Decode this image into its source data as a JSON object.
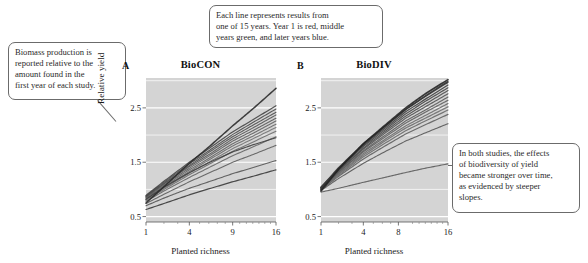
{
  "figure": {
    "background_color": "#ffffff",
    "plot_background_color": "#d4d4d4",
    "gridline_color": "#ffffff"
  },
  "callouts": [
    {
      "id": "biomass",
      "lines": [
        "Biomass production is",
        "reported relative to the",
        "amount found in the",
        "first year of each study."
      ]
    },
    {
      "id": "years",
      "lines": [
        "Each line represents results from",
        "one of 15 years. Year 1 is red, middle",
        "years green, and later years blue."
      ]
    },
    {
      "id": "slopes",
      "lines": [
        "In both studies, the effects",
        "of biodiversity of yield",
        "became stronger over time,",
        "as evidenced by steeper",
        "slopes."
      ]
    }
  ],
  "chart_data": [
    {
      "type": "line",
      "panel_letter": "A",
      "title": "BioCON",
      "xlabel": "Planted richness",
      "ylabel": "Relative yield",
      "x_ticks": [
        1,
        4,
        9,
        16
      ],
      "x_tick_labels": [
        "1",
        "4",
        "9",
        "16"
      ],
      "y_ticks": [
        0.5,
        1.5,
        2.5
      ],
      "y_tick_labels": [
        "0.5",
        "1.5",
        "2.5"
      ],
      "xlim": [
        1,
        16
      ],
      "ylim": [
        0.4,
        3.05
      ],
      "x_scale": "sqrt",
      "grid": true,
      "legend": "none",
      "x": [
        1,
        2,
        4,
        6,
        9,
        12,
        16
      ],
      "series": [
        {
          "name": "Year 1",
          "color": "#3a3a3a",
          "width": 1.2,
          "values": [
            0.63,
            0.74,
            0.9,
            1.01,
            1.14,
            1.24,
            1.36
          ]
        },
        {
          "name": "Year 2",
          "color": "#555555",
          "width": 1.1,
          "values": [
            0.7,
            0.84,
            1.02,
            1.14,
            1.29,
            1.4,
            1.53
          ]
        },
        {
          "name": "Year 3",
          "color": "#5e5e5e",
          "width": 1.1,
          "values": [
            0.74,
            0.91,
            1.14,
            1.3,
            1.5,
            1.64,
            1.81
          ]
        },
        {
          "name": "Year 4",
          "color": "#666666",
          "width": 1.1,
          "values": [
            0.78,
            0.97,
            1.22,
            1.4,
            1.62,
            1.78,
            1.97
          ]
        },
        {
          "name": "Year 5",
          "color": "#6e6e6e",
          "width": 1.1,
          "values": [
            0.8,
            1.0,
            1.27,
            1.46,
            1.7,
            1.87,
            2.07
          ]
        },
        {
          "name": "Year 6",
          "color": "#737373",
          "width": 1.1,
          "values": [
            0.81,
            1.02,
            1.3,
            1.5,
            1.75,
            1.93,
            2.14
          ]
        },
        {
          "name": "Year 7",
          "color": "#6a6a6a",
          "width": 1.1,
          "values": [
            0.82,
            1.04,
            1.33,
            1.54,
            1.8,
            1.98,
            2.2
          ]
        },
        {
          "name": "Year 8",
          "color": "#636363",
          "width": 1.1,
          "values": [
            0.84,
            1.06,
            1.36,
            1.57,
            1.84,
            2.03,
            2.26
          ]
        },
        {
          "name": "Year 9",
          "color": "#5c5c5c",
          "width": 1.1,
          "values": [
            0.85,
            1.08,
            1.39,
            1.61,
            1.89,
            2.08,
            2.31
          ]
        },
        {
          "name": "Year 10",
          "color": "#565656",
          "width": 1.1,
          "values": [
            0.86,
            1.1,
            1.42,
            1.64,
            1.93,
            2.13,
            2.37
          ]
        },
        {
          "name": "Year 11",
          "color": "#4f4f4f",
          "width": 1.1,
          "values": [
            0.87,
            1.11,
            1.44,
            1.68,
            1.97,
            2.18,
            2.42
          ]
        },
        {
          "name": "Year 12",
          "color": "#4a4a4a",
          "width": 1.1,
          "values": [
            0.88,
            1.13,
            1.47,
            1.71,
            2.01,
            2.23,
            2.48
          ]
        },
        {
          "name": "Year 13",
          "color": "#454545",
          "width": 1.2,
          "values": [
            0.89,
            1.15,
            1.5,
            1.75,
            2.06,
            2.28,
            2.54
          ]
        },
        {
          "name": "Year 14",
          "color": "#404040",
          "width": 1.2,
          "values": [
            0.82,
            1.04,
            1.31,
            1.49,
            1.69,
            1.82,
            1.95
          ]
        },
        {
          "name": "Year 15",
          "color": "#2b2b2b",
          "width": 1.5,
          "values": [
            0.75,
            1.05,
            1.48,
            1.78,
            2.17,
            2.48,
            2.86
          ]
        }
      ]
    },
    {
      "type": "line",
      "panel_letter": "B",
      "title": "BioDIV",
      "xlabel": "Planted richness",
      "ylabel": "",
      "x_ticks": [
        1,
        4,
        8,
        16
      ],
      "x_tick_labels": [
        "1",
        "4",
        "8",
        "16"
      ],
      "y_ticks": [
        0.5,
        1.5,
        2.5
      ],
      "y_tick_labels": [
        "0.5",
        "1.5",
        "2.5"
      ],
      "xlim": [
        1,
        16
      ],
      "ylim": [
        0.4,
        3.05
      ],
      "x_scale": "sqrt",
      "grid": true,
      "legend": "none",
      "x": [
        1,
        2,
        4,
        6,
        9,
        12,
        16
      ],
      "series": [
        {
          "name": "Year 1",
          "color": "#5a5a5a",
          "width": 1.1,
          "values": [
            0.95,
            1.02,
            1.13,
            1.21,
            1.31,
            1.39,
            1.47
          ]
        },
        {
          "name": "Year 2",
          "color": "#565656",
          "width": 1.1,
          "values": [
            0.98,
            1.2,
            1.48,
            1.67,
            1.89,
            2.04,
            2.21
          ]
        },
        {
          "name": "Year 3",
          "color": "#606060",
          "width": 1.2,
          "values": [
            0.99,
            1.24,
            1.56,
            1.77,
            2.02,
            2.19,
            2.38
          ]
        },
        {
          "name": "Year 4",
          "color": "#6a6a6a",
          "width": 1.2,
          "values": [
            1.0,
            1.26,
            1.6,
            1.82,
            2.08,
            2.26,
            2.46
          ]
        },
        {
          "name": "Year 5",
          "color": "#707070",
          "width": 1.3,
          "values": [
            1.0,
            1.28,
            1.63,
            1.86,
            2.13,
            2.31,
            2.52
          ]
        },
        {
          "name": "Year 6",
          "color": "#6b6b6b",
          "width": 1.2,
          "values": [
            1.01,
            1.29,
            1.66,
            1.89,
            2.17,
            2.36,
            2.58
          ]
        },
        {
          "name": "Year 7",
          "color": "#636363",
          "width": 1.2,
          "values": [
            1.01,
            1.31,
            1.69,
            1.93,
            2.22,
            2.42,
            2.64
          ]
        },
        {
          "name": "Year 8",
          "color": "#5c5c5c",
          "width": 1.2,
          "values": [
            1.02,
            1.32,
            1.71,
            1.96,
            2.26,
            2.46,
            2.7
          ]
        },
        {
          "name": "Year 9",
          "color": "#545454",
          "width": 1.2,
          "values": [
            1.02,
            1.34,
            1.74,
            2.0,
            2.31,
            2.52,
            2.76
          ]
        },
        {
          "name": "Year 10",
          "color": "#4d4d4d",
          "width": 1.2,
          "values": [
            1.03,
            1.35,
            1.76,
            2.03,
            2.35,
            2.57,
            2.82
          ]
        },
        {
          "name": "Year 11",
          "color": "#474747",
          "width": 1.2,
          "values": [
            1.03,
            1.37,
            1.79,
            2.06,
            2.39,
            2.62,
            2.87
          ]
        },
        {
          "name": "Year 12",
          "color": "#414141",
          "width": 1.3,
          "values": [
            1.04,
            1.38,
            1.81,
            2.09,
            2.43,
            2.66,
            2.92
          ]
        },
        {
          "name": "Year 13",
          "color": "#3a3a3a",
          "width": 1.3,
          "values": [
            1.04,
            1.4,
            1.84,
            2.12,
            2.47,
            2.71,
            2.97
          ]
        },
        {
          "name": "Year 14",
          "color": "#343434",
          "width": 1.4,
          "values": [
            1.0,
            1.38,
            1.83,
            2.12,
            2.47,
            2.72,
            2.99
          ]
        },
        {
          "name": "Year 15",
          "color": "#262626",
          "width": 1.7,
          "values": [
            0.97,
            1.37,
            1.84,
            2.14,
            2.5,
            2.76,
            3.02
          ]
        }
      ]
    }
  ]
}
